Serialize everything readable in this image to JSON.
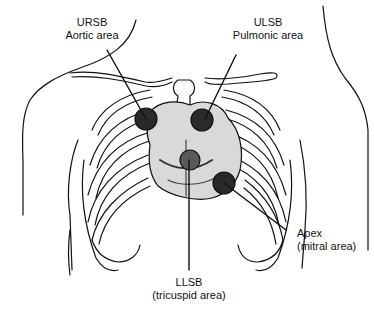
{
  "diagram": {
    "type": "anatomical-illustration",
    "labels": [
      {
        "id": "ursb",
        "line1": "URSB",
        "line2": "Aortic area"
      },
      {
        "id": "ulsb",
        "line1": "ULSB",
        "line2": "Pulmonic area"
      },
      {
        "id": "apex",
        "line1": "Apex",
        "line2": "(mitral area)"
      },
      {
        "id": "llsb",
        "line1": "LLSB",
        "line2": "(tricuspid area)"
      }
    ],
    "colors": {
      "ink": "#111111",
      "marker": "#2a2a2a",
      "background": "#ffffff"
    }
  }
}
